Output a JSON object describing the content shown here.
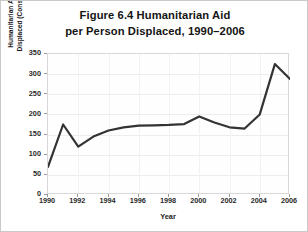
{
  "figure": {
    "title_line1": "Figure 6.4 Humanitarian Aid",
    "title_line2": "per Person Displaced, 1990–2006",
    "border_color": "#c9c9c9",
    "line_color": "#333333",
    "grid_color": "#ededed"
  },
  "axis": {
    "y_title_line1": "Humanitarian Aid per Person",
    "y_title_line2": "Displaced (Constant 2007 USD)",
    "x_title": "Year",
    "y_ticks": [
      "0",
      "50",
      "100",
      "150",
      "200",
      "250",
      "300",
      "350"
    ],
    "x_ticks": [
      "1990",
      "1992",
      "1994",
      "1996",
      "1998",
      "2000",
      "2002",
      "2004",
      "2006"
    ]
  },
  "chart_data": {
    "type": "line",
    "title": "Figure 6.4 Humanitarian Aid per Person Displaced, 1990–2006",
    "xlabel": "Year",
    "ylabel": "Humanitarian Aid per Person Displaced (Constant 2007 USD)",
    "xlim": [
      1990,
      2006
    ],
    "ylim": [
      0,
      350
    ],
    "ytick_values": [
      0,
      50,
      100,
      150,
      200,
      250,
      300,
      350
    ],
    "xtick_values": [
      1990,
      1992,
      1994,
      1996,
      1998,
      2000,
      2002,
      2004,
      2006
    ],
    "grid": "horizontal",
    "legend": "none",
    "x": [
      1990,
      1991,
      1992,
      1993,
      1994,
      1995,
      1996,
      1997,
      1998,
      1999,
      2000,
      2001,
      2002,
      2003,
      2004,
      2005,
      2006
    ],
    "values": [
      70,
      175,
      120,
      145,
      160,
      168,
      172,
      173,
      174,
      176,
      195,
      180,
      168,
      165,
      200,
      325,
      288
    ],
    "series": [
      {
        "name": "Humanitarian aid per person displaced",
        "values": [
          70,
          175,
          120,
          145,
          160,
          168,
          172,
          173,
          174,
          176,
          195,
          180,
          168,
          165,
          200,
          325,
          288
        ]
      }
    ]
  }
}
